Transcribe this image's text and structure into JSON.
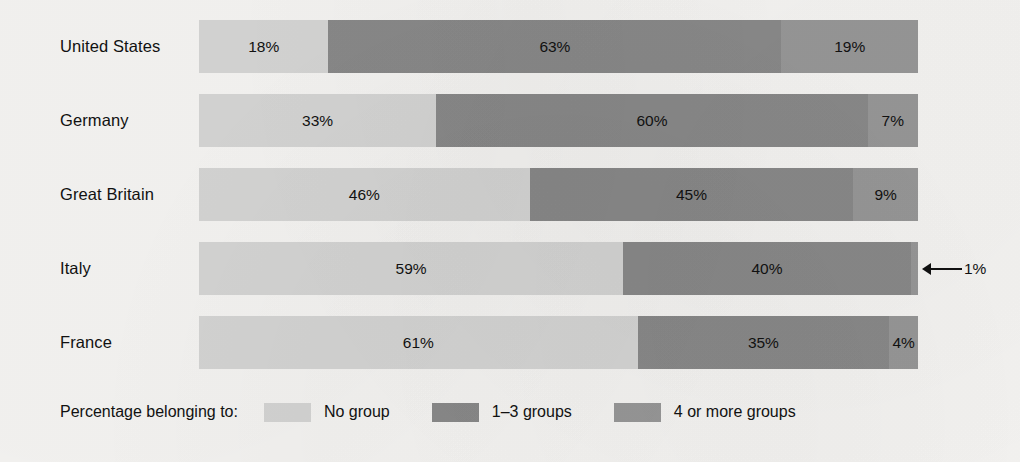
{
  "chart_data": {
    "type": "bar",
    "subtype": "stacked-horizontal-100pct",
    "title": "",
    "xlabel": "",
    "ylabel": "",
    "xlim": [
      0,
      100
    ],
    "grid": false,
    "legend_position": "bottom-left",
    "legend_title": "Percentage belonging to:",
    "categories": [
      "United States",
      "Germany",
      "Great Britain",
      "Italy",
      "France"
    ],
    "series": [
      {
        "name": "No group",
        "color": "#d5d5d4",
        "values": [
          18,
          33,
          46,
          59,
          61
        ]
      },
      {
        "name": "1–3 groups",
        "color": "#898989",
        "values": [
          63,
          60,
          45,
          40,
          35
        ]
      },
      {
        "name": "4 or more groups",
        "color": "#979797",
        "values": [
          19,
          7,
          9,
          1,
          4
        ]
      }
    ],
    "annotations": [
      {
        "category": "Italy",
        "series": "4 or more groups",
        "text": "1%",
        "marker": "left-arrow"
      }
    ]
  },
  "rows": [
    {
      "label": "United States",
      "top": 20,
      "segments": [
        {
          "value": 18,
          "label": "18%",
          "cls": "s0",
          "show_label": true
        },
        {
          "value": 63,
          "label": "63%",
          "cls": "s1",
          "show_label": true
        },
        {
          "value": 19,
          "label": "19%",
          "cls": "s2",
          "show_label": true
        }
      ]
    },
    {
      "label": "Germany",
      "top": 94,
      "segments": [
        {
          "value": 33,
          "label": "33%",
          "cls": "s0",
          "show_label": true
        },
        {
          "value": 60,
          "label": "60%",
          "cls": "s1",
          "show_label": true
        },
        {
          "value": 7,
          "label": "7%",
          "cls": "s2",
          "show_label": true
        }
      ]
    },
    {
      "label": "Great Britain",
      "top": 168,
      "segments": [
        {
          "value": 46,
          "label": "46%",
          "cls": "s0",
          "show_label": true
        },
        {
          "value": 45,
          "label": "45%",
          "cls": "s1",
          "show_label": true
        },
        {
          "value": 9,
          "label": "9%",
          "cls": "s2",
          "show_label": true
        }
      ]
    },
    {
      "label": "Italy",
      "top": 242,
      "callout": "1%",
      "segments": [
        {
          "value": 59,
          "label": "59%",
          "cls": "s0",
          "show_label": true
        },
        {
          "value": 40,
          "label": "40%",
          "cls": "s1",
          "show_label": true
        },
        {
          "value": 1,
          "label": "1%",
          "cls": "s2",
          "show_label": false
        }
      ]
    },
    {
      "label": "France",
      "top": 316,
      "segments": [
        {
          "value": 61,
          "label": "61%",
          "cls": "s0",
          "show_label": true
        },
        {
          "value": 35,
          "label": "35%",
          "cls": "s1",
          "show_label": true
        },
        {
          "value": 4,
          "label": "4%",
          "cls": "s2",
          "show_label": true
        }
      ]
    }
  ],
  "legend": {
    "title": "Percentage belonging to:",
    "items": [
      {
        "label": "No group",
        "cls": "s0"
      },
      {
        "label": "1–3 groups",
        "cls": "s1"
      },
      {
        "label": "4 or more groups",
        "cls": "s2"
      }
    ]
  }
}
